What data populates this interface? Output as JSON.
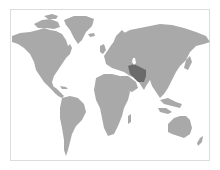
{
  "map": {
    "type": "world-locator-map",
    "colors": {
      "background": "#ffffff",
      "frame_border": "#dcdcdc",
      "land": "#a9a9a9",
      "highlight": "#6b6b6b"
    },
    "highlighted_region": {
      "name": "Iran",
      "approx_center_px": [
        137,
        72
      ]
    }
  }
}
